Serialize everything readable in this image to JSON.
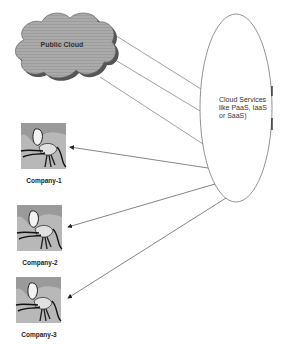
{
  "public_cloud": {
    "label": "Public Cloud",
    "fill": "#a9a9a9",
    "shadow": "#5a5a5a"
  },
  "cloud_services": {
    "label": "Cloud Services like PaaS, IaaS or SaaS)"
  },
  "companies": [
    {
      "label": "Company-1"
    },
    {
      "label": "Company-2"
    },
    {
      "label": "Company-3"
    }
  ],
  "colors": {
    "line": "#777777",
    "text": "#333333"
  }
}
